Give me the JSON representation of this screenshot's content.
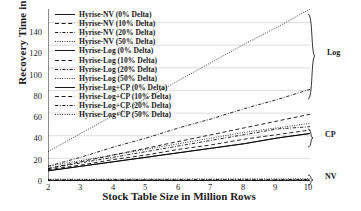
{
  "chart_data": {
    "type": "line",
    "title": "",
    "xlabel": "Stock Table Size in Million Rows",
    "ylabel": "Recovery Time in s",
    "xlim": [
      2,
      10
    ],
    "ylim": [
      0,
      152
    ],
    "grid": true,
    "legend_position": "upper-left",
    "x": [
      2,
      3,
      4,
      5,
      6,
      7,
      8,
      9,
      10
    ],
    "xticks": [
      "2",
      "3",
      "4",
      "5",
      "6",
      "7",
      "8",
      "9",
      "10"
    ],
    "yticks": [
      "0",
      "20",
      "40",
      "60",
      "80",
      "100",
      "120",
      "140"
    ],
    "series": [
      {
        "name": "Hyrise-NV (0% Delta)",
        "style": "solid",
        "group": "NV",
        "values": [
          0.2,
          0.2,
          0.2,
          0.2,
          0.2,
          0.2,
          0.2,
          0.2,
          0.2
        ]
      },
      {
        "name": "Hyrise-NV (10% Delta)",
        "style": "dashed",
        "group": "NV",
        "values": [
          0.6,
          0.6,
          0.6,
          0.6,
          0.6,
          0.6,
          0.6,
          0.7,
          0.7
        ]
      },
      {
        "name": "Hyrise-NV (20% Delta)",
        "style": "dashdot",
        "group": "NV",
        "values": [
          1.0,
          1.0,
          1.1,
          1.1,
          1.1,
          1.2,
          1.2,
          1.2,
          1.3
        ]
      },
      {
        "name": "Hyrise-NV (50% Delta)",
        "style": "dotted",
        "group": "NV",
        "values": [
          1.6,
          1.6,
          1.7,
          1.7,
          1.8,
          1.8,
          1.9,
          1.9,
          2.0
        ]
      },
      {
        "name": "Hyrise-Log (0% Delta)",
        "style": "solid",
        "group": "Log",
        "values": [
          9,
          13,
          17,
          21,
          25,
          29,
          33,
          38,
          42
        ]
      },
      {
        "name": "Hyrise-Log (10% Delta)",
        "style": "dashed",
        "group": "Log",
        "values": [
          11,
          17,
          23,
          29,
          35,
          41,
          47,
          53,
          59
        ]
      },
      {
        "name": "Hyrise-Log (20% Delta)",
        "style": "dashdot",
        "group": "Log",
        "values": [
          13,
          21,
          30,
          38,
          47,
          55,
          64,
          72,
          81
        ]
      },
      {
        "name": "Hyrise-Log (50% Delta)",
        "style": "dotted",
        "group": "Log",
        "values": [
          26,
          42,
          58,
          73,
          89,
          105,
          121,
          136,
          152
        ]
      },
      {
        "name": "Hyrise-Log+CP (0% Delta)",
        "style": "solid",
        "group": "CP",
        "values": [
          9,
          13,
          17,
          21,
          25,
          29,
          33,
          38,
          42
        ]
      },
      {
        "name": "Hyrise-Log+CP (10% Delta)",
        "style": "dashed",
        "group": "CP",
        "values": [
          10,
          14,
          19,
          23,
          28,
          32,
          37,
          41,
          45
        ]
      },
      {
        "name": "Hyrise-Log+CP (20% Delta)",
        "style": "dashdot",
        "group": "CP",
        "values": [
          11,
          16,
          21,
          26,
          31,
          36,
          41,
          46,
          48
        ]
      },
      {
        "name": "Hyrise-Log+CP (50% Delta)",
        "style": "dotted",
        "group": "CP",
        "values": [
          13,
          18,
          23,
          28,
          33,
          38,
          43,
          47,
          51
        ]
      }
    ],
    "annotations": [
      {
        "label": "Log",
        "type": "brace",
        "span_label": "upper group"
      },
      {
        "label": "CP",
        "type": "brace",
        "span_label": "middle group"
      },
      {
        "label": "NV",
        "type": "brace",
        "span_label": "lower group"
      }
    ]
  },
  "colors": {
    "line": "#000000",
    "grid": "#cfcfcf",
    "axis": "#000000",
    "background": "#ffffff"
  }
}
